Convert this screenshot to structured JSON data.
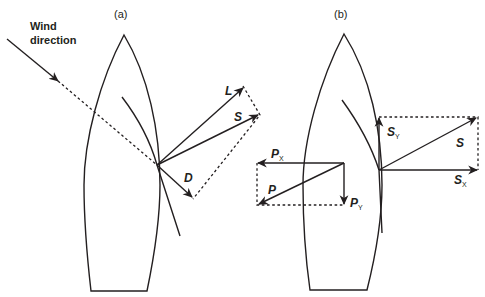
{
  "figure": {
    "panels": [
      {
        "id": "a",
        "label": "(a)",
        "wind_label_line1": "Wind",
        "wind_label_line2": "direction",
        "vectors": {
          "lift": "L",
          "sail_force": "S",
          "drag": "D"
        }
      },
      {
        "id": "b",
        "label": "(b)",
        "vectors": {
          "sail_force": "S",
          "sail_y": "S",
          "sail_y_sub": "Y",
          "sail_x": "S",
          "sail_x_sub": "X",
          "resistance": "P",
          "resistance_x": "P",
          "resistance_x_sub": "X",
          "resistance_y": "P",
          "resistance_y_sub": "Y"
        }
      }
    ],
    "colors": {
      "stroke": "#231f20",
      "background": "#ffffff"
    }
  }
}
